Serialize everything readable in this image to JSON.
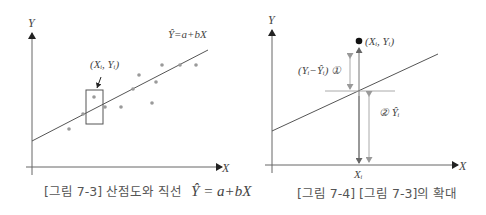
{
  "figure_left": {
    "axis_y_label": "Y",
    "axis_x_label": "X",
    "equation_label": "Ŷ=a+bX",
    "point_label": "(Xᵢ, Yᵢ)",
    "caption_prefix": "[그림 7-3] 산점도와 직선",
    "caption_math": "Ŷ = a+bX",
    "line_color": "#555555",
    "point_color": "#9a9a9a",
    "scatter_points": [
      {
        "x": 69,
        "y": 129
      },
      {
        "x": 83,
        "y": 114
      },
      {
        "x": 94,
        "y": 97
      },
      {
        "x": 105,
        "y": 107
      },
      {
        "x": 121,
        "y": 107
      },
      {
        "x": 133,
        "y": 89
      },
      {
        "x": 139,
        "y": 75
      },
      {
        "x": 152,
        "y": 103
      },
      {
        "x": 156,
        "y": 82
      },
      {
        "x": 162,
        "y": 65
      },
      {
        "x": 180,
        "y": 65
      },
      {
        "x": 196,
        "y": 65
      }
    ]
  },
  "figure_right": {
    "axis_y_label": "Y",
    "axis_x_label": "X",
    "point_label": "(Xᵢ, Yᵢ)",
    "residual_label": "(Yᵢ−Ŷᵢ) ①",
    "fitted_label": "② Ŷᵢ",
    "xi_label": "Xᵢ",
    "caption": "[그림 7-4] [그림 7-3]의 확대",
    "arrow_color": "#aaaaaa"
  }
}
